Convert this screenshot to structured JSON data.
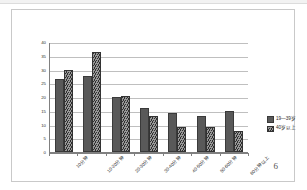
{
  "page": {
    "page_number": "6"
  },
  "legend": {
    "position": "right",
    "items": [
      {
        "label": "19—39岁",
        "swatch": "s1",
        "color": "#595959"
      },
      {
        "label": "40岁以上",
        "swatch": "s2",
        "color": "#6b6b6b"
      }
    ]
  },
  "chart_data": {
    "type": "bar",
    "title": "",
    "subtitle": "",
    "xlabel": "",
    "ylabel": "",
    "ylim": [
      0,
      40
    ],
    "ytick_step": 5,
    "grid": true,
    "legend_position": "right",
    "categories": [
      "10分钟",
      "10-20分钟",
      "20-30分钟",
      "30-40分钟",
      "40-50分钟",
      "50-60分钟",
      "60分钟以上"
    ],
    "ytick_labels": [
      "0",
      "5",
      "10",
      "15",
      "20",
      "25",
      "30",
      "35",
      "40"
    ],
    "series": [
      {
        "name": "19—39岁",
        "color": "#595959",
        "values": [
          26,
          27,
          19.5,
          15.5,
          13.5,
          12.5,
          14.5
        ]
      },
      {
        "name": "40岁以上",
        "color": "#6b6b6b",
        "values": [
          29.5,
          36,
          20,
          12.5,
          8.5,
          8.5,
          7
        ]
      }
    ]
  }
}
